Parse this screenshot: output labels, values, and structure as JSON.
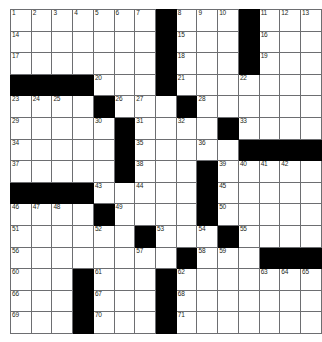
{
  "puzzle": {
    "title": "Crossword Puzzle Grid",
    "rows": 15,
    "cols": 15,
    "cell_size_px": 20,
    "colors": {
      "block": "#000000",
      "grid_line": "#6d6e71",
      "background": "#ffffff",
      "number_text": "#231f20"
    },
    "legend": {
      "blocked_symbol": "#",
      "open_symbol": "."
    },
    "grid": [
      ".......#...#...",
      ".......#...#...",
      ".......#...#...",
      "####...#....!..",
      "....#..!#!.....",
      "....!#.!.!#!...",
      ".....#!..!.####",
      ".....#!..#!!!!.",
      "####.!.!.#!....",
      "...!#!...#!....",
      "....!!#!!!#!...",
      "......!!#!!!###",
      "...#!..#!..!!!!",
      "...#!..#!......",
      "...#!..#!......"
    ],
    "numbers": [
      {
        "r": 1,
        "c": 1,
        "n": "1"
      },
      {
        "r": 1,
        "c": 2,
        "n": "2"
      },
      {
        "r": 1,
        "c": 3,
        "n": "3"
      },
      {
        "r": 1,
        "c": 4,
        "n": "4"
      },
      {
        "r": 1,
        "c": 5,
        "n": "5"
      },
      {
        "r": 1,
        "c": 6,
        "n": "6"
      },
      {
        "r": 1,
        "c": 7,
        "n": "7"
      },
      {
        "r": 1,
        "c": 9,
        "n": "8"
      },
      {
        "r": 1,
        "c": 10,
        "n": "9"
      },
      {
        "r": 1,
        "c": 11,
        "n": "10"
      },
      {
        "r": 1,
        "c": 13,
        "n": "11"
      },
      {
        "r": 1,
        "c": 14,
        "n": "12"
      },
      {
        "r": 1,
        "c": 15,
        "n": "13"
      },
      {
        "r": 2,
        "c": 1,
        "n": "14"
      },
      {
        "r": 2,
        "c": 9,
        "n": "15"
      },
      {
        "r": 2,
        "c": 13,
        "n": "16"
      },
      {
        "r": 3,
        "c": 1,
        "n": "17"
      },
      {
        "r": 3,
        "c": 9,
        "n": "18"
      },
      {
        "r": 3,
        "c": 13,
        "n": "19"
      },
      {
        "r": 4,
        "c": 5,
        "n": "20"
      },
      {
        "r": 4,
        "c": 9,
        "n": "21"
      },
      {
        "r": 4,
        "c": 12,
        "n": "22"
      },
      {
        "r": 5,
        "c": 1,
        "n": "23"
      },
      {
        "r": 5,
        "c": 2,
        "n": "24"
      },
      {
        "r": 5,
        "c": 3,
        "n": "25"
      },
      {
        "r": 5,
        "c": 6,
        "n": "26"
      },
      {
        "r": 5,
        "c": 7,
        "n": "27"
      },
      {
        "r": 5,
        "c": 10,
        "n": "28"
      },
      {
        "r": 6,
        "c": 1,
        "n": "29"
      },
      {
        "r": 6,
        "c": 5,
        "n": "30"
      },
      {
        "r": 6,
        "c": 7,
        "n": "31"
      },
      {
        "r": 6,
        "c": 9,
        "n": "32"
      },
      {
        "r": 6,
        "c": 12,
        "n": "33"
      },
      {
        "r": 7,
        "c": 1,
        "n": "34"
      },
      {
        "r": 7,
        "c": 7,
        "n": "35"
      },
      {
        "r": 7,
        "c": 10,
        "n": "36"
      },
      {
        "r": 8,
        "c": 1,
        "n": "37"
      },
      {
        "r": 8,
        "c": 7,
        "n": "38"
      },
      {
        "r": 8,
        "c": 11,
        "n": "39"
      },
      {
        "r": 8,
        "c": 12,
        "n": "40"
      },
      {
        "r": 8,
        "c": 13,
        "n": "41"
      },
      {
        "r": 8,
        "c": 14,
        "n": "42"
      },
      {
        "r": 9,
        "c": 5,
        "n": "43"
      },
      {
        "r": 9,
        "c": 7,
        "n": "44"
      },
      {
        "r": 9,
        "c": 11,
        "n": "45"
      },
      {
        "r": 10,
        "c": 1,
        "n": "46"
      },
      {
        "r": 10,
        "c": 2,
        "n": "47"
      },
      {
        "r": 10,
        "c": 3,
        "n": "48"
      },
      {
        "r": 10,
        "c": 6,
        "n": "49"
      },
      {
        "r": 10,
        "c": 11,
        "n": "50"
      },
      {
        "r": 11,
        "c": 1,
        "n": "51"
      },
      {
        "r": 11,
        "c": 5,
        "n": "52"
      },
      {
        "r": 11,
        "c": 8,
        "n": "53"
      },
      {
        "r": 11,
        "c": 10,
        "n": "54"
      },
      {
        "r": 11,
        "c": 12,
        "n": "55"
      },
      {
        "r": 12,
        "c": 1,
        "n": "56"
      },
      {
        "r": 12,
        "c": 7,
        "n": "57"
      },
      {
        "r": 12,
        "c": 10,
        "n": "58"
      },
      {
        "r": 12,
        "c": 11,
        "n": "59"
      },
      {
        "r": 13,
        "c": 1,
        "n": "60"
      },
      {
        "r": 13,
        "c": 5,
        "n": "61"
      },
      {
        "r": 13,
        "c": 9,
        "n": "62"
      },
      {
        "r": 13,
        "c": 13,
        "n": "63"
      },
      {
        "r": 13,
        "c": 14,
        "n": "64"
      },
      {
        "r": 13,
        "c": 15,
        "n": "65"
      },
      {
        "r": 14,
        "c": 1,
        "n": "66"
      },
      {
        "r": 14,
        "c": 5,
        "n": "67"
      },
      {
        "r": 14,
        "c": 9,
        "n": "68"
      },
      {
        "r": 15,
        "c": 1,
        "n": "69"
      },
      {
        "r": 15,
        "c": 5,
        "n": "70"
      },
      {
        "r": 15,
        "c": 9,
        "n": "71"
      }
    ],
    "entries": []
  }
}
